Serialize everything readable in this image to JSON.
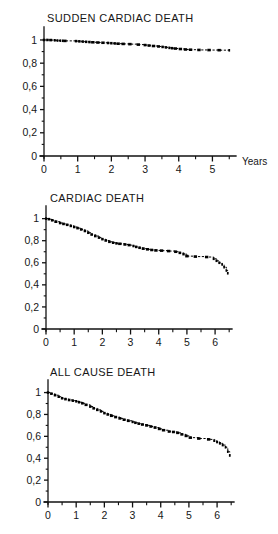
{
  "figure": {
    "name": "kaplan-meier-survival-panels",
    "background": "#ffffff",
    "ink": "#000000"
  },
  "chart_data": [
    {
      "type": "line",
      "id": "sudden-cardiac-death",
      "title": "SUDDEN CARDIAC DEATH",
      "xlabel": "Years",
      "ylabel": "",
      "xlim": [
        0,
        5.7
      ],
      "ylim": [
        0,
        1.06
      ],
      "grid": false,
      "legend": null,
      "xticks": [
        0,
        1,
        2,
        3,
        4,
        5
      ],
      "xticklabels": [
        "0",
        "1",
        "2",
        "3",
        "4",
        "5"
      ],
      "xminorticks": [
        0.5,
        1.5,
        2.5,
        3.5,
        4.5,
        5.5
      ],
      "yticks": [
        0,
        0.2,
        0.4,
        0.6,
        0.8,
        1
      ],
      "yticklabels": [
        "0",
        "0,2",
        "0,4",
        "0,6",
        "0,8",
        "1"
      ],
      "yminorticks": [
        0.1,
        0.3,
        0.5,
        0.7,
        0.9
      ],
      "series": [
        {
          "name": "sudden cardiac death free survival",
          "style": "step-dashed-with-censor-marks",
          "x": [
            0.0,
            0.1,
            0.2,
            0.32,
            0.4,
            0.48,
            0.55,
            0.62,
            0.95,
            1.05,
            1.15,
            1.25,
            1.35,
            1.45,
            1.6,
            1.75,
            1.9,
            2.0,
            2.1,
            2.2,
            2.35,
            2.55,
            2.8,
            3.0,
            3.12,
            3.25,
            3.4,
            3.52,
            3.62,
            3.72,
            3.8,
            3.9,
            4.05,
            4.2,
            4.35,
            4.6,
            4.9,
            5.2,
            5.5
          ],
          "y": [
            1.0,
            1.0,
            0.999,
            0.997,
            0.995,
            0.994,
            0.993,
            0.992,
            0.99,
            0.988,
            0.986,
            0.984,
            0.982,
            0.98,
            0.978,
            0.976,
            0.974,
            0.972,
            0.97,
            0.968,
            0.966,
            0.964,
            0.96,
            0.956,
            0.952,
            0.948,
            0.944,
            0.94,
            0.936,
            0.932,
            0.929,
            0.926,
            0.922,
            0.918,
            0.916,
            0.914,
            0.913,
            0.912,
            0.911
          ]
        }
      ]
    },
    {
      "type": "line",
      "id": "cardiac-death",
      "title": "CARDIAC DEATH",
      "xlabel": "",
      "ylabel": "",
      "xlim": [
        0,
        6.6
      ],
      "ylim": [
        0,
        1.06
      ],
      "grid": false,
      "legend": null,
      "xticks": [
        0,
        1,
        2,
        3,
        4,
        5,
        6
      ],
      "xticklabels": [
        "0",
        "1",
        "2",
        "3",
        "4",
        "5",
        "6"
      ],
      "xminorticks": [
        0.5,
        1.5,
        2.5,
        3.5,
        4.5,
        5.5,
        6.5
      ],
      "yticks": [
        0,
        0.2,
        0.4,
        0.6,
        0.8,
        1
      ],
      "yticklabels": [
        "0",
        "0,2",
        "0,4",
        "0,6",
        "0,8",
        "1"
      ],
      "yminorticks": [
        0.1,
        0.3,
        0.5,
        0.7,
        0.9
      ],
      "series": [
        {
          "name": "cardiac death free survival",
          "style": "step-dashed-with-censor-marks",
          "x": [
            0.0,
            0.1,
            0.22,
            0.35,
            0.5,
            0.62,
            0.75,
            0.88,
            1.0,
            1.12,
            1.25,
            1.38,
            1.5,
            1.62,
            1.75,
            1.88,
            2.0,
            2.12,
            2.25,
            2.38,
            2.5,
            2.62,
            2.8,
            2.95,
            3.1,
            3.2,
            3.32,
            3.45,
            3.6,
            3.75,
            3.9,
            4.1,
            4.35,
            4.6,
            4.75,
            4.88,
            5.0,
            5.3,
            5.7,
            5.95,
            6.05,
            6.15,
            6.25,
            6.32,
            6.4,
            6.45
          ],
          "y": [
            1.0,
            0.995,
            0.985,
            0.972,
            0.96,
            0.952,
            0.944,
            0.934,
            0.924,
            0.914,
            0.902,
            0.888,
            0.872,
            0.856,
            0.842,
            0.828,
            0.814,
            0.802,
            0.79,
            0.782,
            0.776,
            0.772,
            0.766,
            0.76,
            0.752,
            0.744,
            0.736,
            0.728,
            0.722,
            0.716,
            0.712,
            0.71,
            0.706,
            0.7,
            0.69,
            0.678,
            0.66,
            0.656,
            0.652,
            0.636,
            0.618,
            0.6,
            0.584,
            0.56,
            0.53,
            0.505
          ]
        }
      ]
    },
    {
      "type": "line",
      "id": "all-cause-death",
      "title": "ALL CAUSE DEATH",
      "xlabel": "",
      "ylabel": "",
      "xlim": [
        0,
        6.6
      ],
      "ylim": [
        0,
        1.06
      ],
      "grid": false,
      "legend": null,
      "xticks": [
        0,
        1,
        2,
        3,
        4,
        5,
        6
      ],
      "xticklabels": [
        "0",
        "1",
        "2",
        "3",
        "4",
        "5",
        "6"
      ],
      "xminorticks": [
        0.5,
        1.5,
        2.5,
        3.5,
        4.5,
        5.5,
        6.5
      ],
      "yticks": [
        0,
        0.2,
        0.4,
        0.6,
        0.8,
        1
      ],
      "yticklabels": [
        "0",
        "0,2",
        "0,4",
        "0,6",
        "0,8",
        "1"
      ],
      "yminorticks": [
        0.1,
        0.3,
        0.5,
        0.7,
        0.9
      ],
      "series": [
        {
          "name": "all cause survival",
          "style": "step-dashed-with-censor-marks",
          "x": [
            0.0,
            0.12,
            0.25,
            0.38,
            0.5,
            0.62,
            0.75,
            0.88,
            1.0,
            1.1,
            1.22,
            1.35,
            1.5,
            1.62,
            1.75,
            1.88,
            2.0,
            2.12,
            2.25,
            2.4,
            2.55,
            2.7,
            2.85,
            3.0,
            3.1,
            3.22,
            3.35,
            3.5,
            3.65,
            3.8,
            3.95,
            4.1,
            4.3,
            4.45,
            4.6,
            4.75,
            4.9,
            5.05,
            5.35,
            5.7,
            5.9,
            6.0,
            6.1,
            6.2,
            6.3,
            6.38,
            6.45
          ],
          "y": [
            1.0,
            0.99,
            0.976,
            0.962,
            0.948,
            0.94,
            0.932,
            0.926,
            0.92,
            0.912,
            0.902,
            0.888,
            0.872,
            0.856,
            0.842,
            0.828,
            0.812,
            0.8,
            0.788,
            0.776,
            0.764,
            0.752,
            0.742,
            0.732,
            0.724,
            0.716,
            0.708,
            0.7,
            0.69,
            0.68,
            0.668,
            0.656,
            0.644,
            0.64,
            0.632,
            0.618,
            0.604,
            0.588,
            0.58,
            0.572,
            0.56,
            0.548,
            0.536,
            0.52,
            0.5,
            0.46,
            0.425
          ]
        }
      ]
    }
  ]
}
